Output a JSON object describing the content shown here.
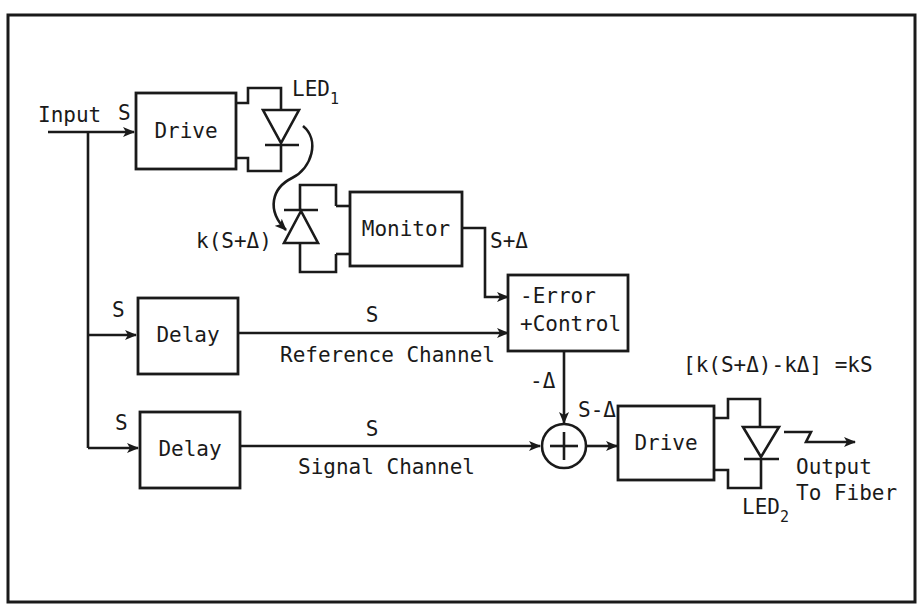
{
  "diagram": {
    "input_label": "Input",
    "blocks": {
      "drive1": "Drive",
      "monitor": "Monitor",
      "delay_ref": "Delay",
      "delay_sig": "Delay",
      "error_control_line1": "-Error",
      "error_control_line2": "+Control",
      "drive2": "Drive"
    },
    "leds": {
      "led1": {
        "main": "LED",
        "sub": "1"
      },
      "led2": {
        "main": "LED",
        "sub": "2"
      }
    },
    "signals": {
      "s_drive1": "S",
      "s_delay_ref_in": "S",
      "s_delay_sig_in": "S",
      "s_ref_out": "S",
      "s_sig_out": "S",
      "photodiode": "k(S+Δ)",
      "monitor_out": "S+Δ",
      "error_out": "-Δ",
      "sum_out": "S-Δ"
    },
    "channels": {
      "reference": "Reference Channel",
      "signal": "Signal Channel"
    },
    "equation": "[k(S+Δ)-kΔ] =kS",
    "output_line1": "Output",
    "output_line2": "To Fiber",
    "summing_symbol": "+"
  }
}
